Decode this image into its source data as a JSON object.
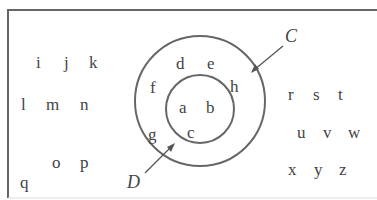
{
  "diagram": {
    "type": "venn-nested-sets",
    "outer_set_label": "C",
    "inner_set_label": "D",
    "inner_set": [
      "a",
      "b",
      "c"
    ],
    "outer_ring": [
      "d",
      "e",
      "f",
      "g",
      "h"
    ],
    "universal_left": [
      "i",
      "j",
      "k",
      "l",
      "m",
      "n",
      "o",
      "p",
      "q"
    ],
    "universal_right": [
      "r",
      "s",
      "t",
      "u",
      "v",
      "w",
      "x",
      "y",
      "z"
    ]
  },
  "labels": {
    "i": "i",
    "j": "j",
    "k": "k",
    "l": "l",
    "m": "m",
    "n": "n",
    "o": "o",
    "p": "p",
    "q": "q",
    "a": "a",
    "b": "b",
    "c": "c",
    "d": "d",
    "e": "e",
    "f": "f",
    "g": "g",
    "h": "h",
    "r": "r",
    "s": "s",
    "t": "t",
    "u": "u",
    "v": "v",
    "w": "w",
    "x": "x",
    "y": "y",
    "z": "z",
    "C": "C",
    "D": "D"
  },
  "colors": {
    "stroke": "#555555",
    "text": "#444444"
  }
}
